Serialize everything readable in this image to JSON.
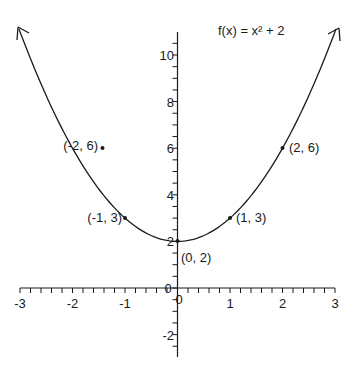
{
  "chart_data": {
    "type": "line",
    "title": "f(x) = x² + 2",
    "function": "x^2 + 2",
    "xlabel": "",
    "ylabel": "",
    "xlim": [
      -3,
      3
    ],
    "ylim": [
      -3,
      11
    ],
    "grid": false,
    "x_ticks": [
      -3,
      -2,
      -1,
      0,
      1,
      2,
      3
    ],
    "y_ticks": [
      -2,
      0,
      2,
      4,
      6,
      8,
      10
    ],
    "x_minor_step": 0.2,
    "y_minor_step": 0.5,
    "series": [
      {
        "name": "f(x) = x² + 2",
        "x": [
          -3,
          -2,
          -1,
          0,
          1,
          2,
          3
        ],
        "values": [
          11,
          6,
          3,
          2,
          3,
          6,
          11
        ],
        "arrows_at_ends": true
      }
    ],
    "points": [
      {
        "x": -2,
        "y": 6,
        "label": "(-2, 6)"
      },
      {
        "x": -1,
        "y": 3,
        "label": "(-1, 3)"
      },
      {
        "x": 0,
        "y": 2,
        "label": "(0, 2)"
      },
      {
        "x": 1,
        "y": 3,
        "label": "(1, 3)"
      },
      {
        "x": 2,
        "y": 6,
        "label": "(2, 6)"
      }
    ],
    "colors": {
      "curve": "#1a1a1a",
      "axes": "#1a1a1a",
      "background": "#ffffff"
    }
  },
  "labels": {
    "title": "f(x) = x² + 2",
    "x_ticks": [
      "-3",
      "-2",
      "-1",
      "0",
      "1",
      "2",
      "3"
    ],
    "y_ticks": [
      "-2",
      "0",
      "2",
      "4",
      "6",
      "8",
      "10"
    ],
    "points": [
      "(-2, 6)",
      "(-1, 3)",
      "(0, 2)",
      "(1, 3)",
      "(2, 6)"
    ]
  }
}
